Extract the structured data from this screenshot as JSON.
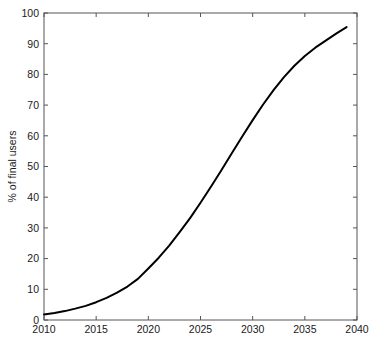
{
  "chart_data": {
    "type": "line",
    "title": "",
    "xlabel": "",
    "ylabel": "% of final users",
    "xlim": [
      2010,
      2040
    ],
    "ylim": [
      0,
      100
    ],
    "grid": false,
    "legend": null,
    "xticks": [
      2010,
      2015,
      2020,
      2025,
      2030,
      2035,
      2040
    ],
    "xtick_labels": [
      "2010",
      "2015",
      "2020",
      "2025",
      "2030",
      "2035",
      "2040"
    ],
    "yticks": [
      0,
      10,
      20,
      30,
      40,
      50,
      60,
      70,
      80,
      90,
      100
    ],
    "ytick_labels": [
      "0",
      "10",
      "20",
      "30",
      "40",
      "50",
      "60",
      "70",
      "80",
      "90",
      "100"
    ],
    "series": [
      {
        "name": "adoption",
        "color": "#000000",
        "linewidth": 2,
        "x": [
          2010,
          2011,
          2012,
          2013,
          2014,
          2015,
          2016,
          2017,
          2018,
          2019,
          2020,
          2021,
          2022,
          2023,
          2024,
          2025,
          2026,
          2027,
          2028,
          2029,
          2030,
          2031,
          2032,
          2033,
          2034,
          2035,
          2036,
          2037,
          2038,
          2039
        ],
        "values": [
          1.8,
          2.3,
          2.9,
          3.7,
          4.6,
          5.8,
          7.2,
          8.9,
          10.9,
          13.4,
          16.8,
          20.3,
          24.2,
          28.6,
          33.2,
          38.2,
          43.4,
          48.8,
          54.3,
          59.8,
          65.1,
          70.2,
          74.9,
          79.1,
          82.8,
          86.0,
          88.7,
          91.0,
          93.3,
          95.4
        ]
      }
    ]
  },
  "axes": {
    "box_color": "#4d4d4d",
    "background": "#ffffff",
    "tick_direction": "in"
  }
}
